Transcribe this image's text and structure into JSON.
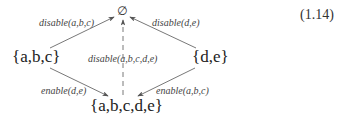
{
  "equation_number": "(1.14)",
  "nodes": {
    "empty_set": "∅",
    "abc": "{a,b,c}",
    "de": "{d,e}",
    "abcde": "{a,b,c,d,e}"
  },
  "edges": {
    "abc_to_empty": "disable(a,b,c)",
    "de_to_empty": "disable(d,e)",
    "abcde_to_empty": "disable(a,b,c,d,e)",
    "abc_to_abcde": "enable(d,e)",
    "de_to_abcde": "enable(a,b,c)"
  },
  "colors": {
    "line": "#555555",
    "text": "#333333"
  }
}
